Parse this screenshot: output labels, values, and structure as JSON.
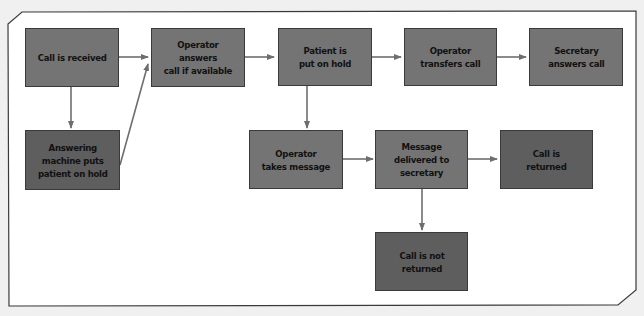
{
  "diagram": {
    "type": "flowchart",
    "colors": {
      "background": "#f0f0f0",
      "panel": "#ffffff",
      "box": "#747474",
      "box_dark": "#5e5e5e",
      "arrow": "#6e6e6e",
      "border": "#3a3a3a"
    },
    "nodes": [
      {
        "id": "n1",
        "label": "Call is received"
      },
      {
        "id": "n2",
        "label": "Operator\nanswers\ncall if available"
      },
      {
        "id": "n3",
        "label": "Patient is\nput on hold"
      },
      {
        "id": "n4",
        "label": "Operator\ntransfers call"
      },
      {
        "id": "n5",
        "label": "Secretary\nanswers call"
      },
      {
        "id": "n6",
        "label": "Answering\nmachine puts\npatient on hold"
      },
      {
        "id": "n7",
        "label": "Operator\ntakes message"
      },
      {
        "id": "n8",
        "label": "Message\ndelivered to\nsecretary"
      },
      {
        "id": "n9",
        "label": "Call is\nreturned"
      },
      {
        "id": "n10",
        "label": "Call is not\nreturned"
      }
    ],
    "edges": [
      {
        "from": "n1",
        "to": "n2"
      },
      {
        "from": "n2",
        "to": "n3"
      },
      {
        "from": "n3",
        "to": "n4"
      },
      {
        "from": "n4",
        "to": "n5"
      },
      {
        "from": "n1",
        "to": "n6"
      },
      {
        "from": "n6",
        "to": "n2"
      },
      {
        "from": "n3",
        "to": "n7"
      },
      {
        "from": "n7",
        "to": "n8"
      },
      {
        "from": "n8",
        "to": "n9"
      },
      {
        "from": "n8",
        "to": "n10"
      }
    ]
  }
}
